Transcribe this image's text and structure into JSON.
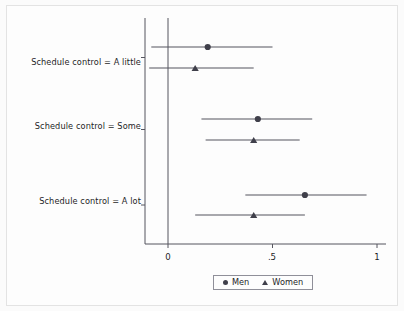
{
  "chart_data": {
    "type": "scatter",
    "subtype": "coefficient-forest-plot",
    "title": "",
    "subtitle": "",
    "xlabel": "",
    "ylabel": "",
    "xlim": [
      -0.12,
      1.02
    ],
    "xticks": [
      0,
      0.5,
      1
    ],
    "xticklabels": [
      "0",
      ".5",
      "1"
    ],
    "grid": false,
    "reference_line": 0,
    "legend_position": "bottom-center",
    "categories": [
      "Schedule control = A little",
      "Schedule control = Some",
      "Schedule control = A lot"
    ],
    "series": [
      {
        "name": "Men",
        "marker": "circle",
        "color": "#3f3f4a",
        "values": [
          0.19,
          0.43,
          0.655
        ],
        "ci_low": [
          -0.08,
          0.16,
          0.37
        ],
        "ci_high": [
          0.5,
          0.69,
          0.95
        ]
      },
      {
        "name": "Women",
        "marker": "triangle",
        "color": "#3f3f4a",
        "values": [
          0.13,
          0.41,
          0.41
        ],
        "ci_low": [
          -0.09,
          0.18,
          0.13
        ],
        "ci_high": [
          0.41,
          0.63,
          0.655
        ]
      }
    ]
  },
  "axis": {
    "tick_labels": [
      "0",
      ".5",
      "1"
    ],
    "category_labels": [
      "Schedule control = A little",
      "Schedule control = Some",
      "Schedule control = A lot"
    ]
  },
  "legend": {
    "items": [
      {
        "label": "Men",
        "marker": "circle-marker-icon"
      },
      {
        "label": "Women",
        "marker": "triangle-marker-icon"
      }
    ]
  },
  "colors": {
    "marker": "#3f3f4a",
    "line": "#55555f",
    "axis": "#55555f",
    "text": "#1d1d27",
    "background": "#fdfdfd",
    "figure_border": "#e3e3e3",
    "legend_border": "#8f8f99"
  }
}
